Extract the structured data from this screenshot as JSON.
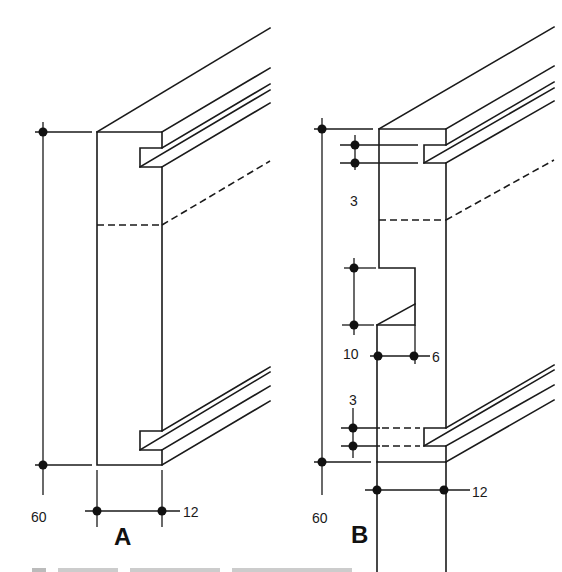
{
  "figure": {
    "type": "technical-drawing",
    "views": [
      {
        "id": "A",
        "label": "A",
        "dimensions": {
          "height": "60",
          "width": "12"
        }
      },
      {
        "id": "B",
        "label": "B",
        "dimensions": {
          "height": "60",
          "width": "12",
          "groove_top": "3",
          "groove_bottom": "3",
          "notch_height": "10",
          "notch_depth": "6"
        }
      }
    ],
    "caption_visible": false
  },
  "colors": {
    "ink": "#1a1a1a",
    "paper": "#ffffff"
  }
}
